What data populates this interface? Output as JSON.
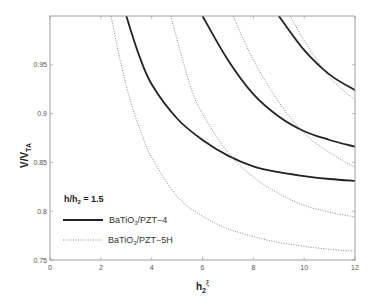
{
  "chart_data": {
    "type": "line",
    "title": "",
    "xlabel": "h2ξ",
    "xlabel_main": "h",
    "xlabel_sub": "2",
    "xlabel_sup": "ξ",
    "ylabel": "V/VTA",
    "ylabel_main": "V/V",
    "ylabel_sub": "TA",
    "xlim": [
      0,
      12
    ],
    "ylim": [
      0.75,
      1.0
    ],
    "xticks": [
      "0",
      "2",
      "4",
      "6",
      "8",
      "10",
      "12"
    ],
    "yticks": [
      "0.75",
      "0.8",
      "0.85",
      "0.9",
      "0.95"
    ],
    "grid": false,
    "legend": {
      "position": "lower-left",
      "title": "h/h₂ = 1.5",
      "title_main": "h/h",
      "title_sub": "2",
      "title_rest": " = 1.5",
      "entries": [
        {
          "label": "BaTiO3/PZT-4",
          "main": "BaTiO",
          "sub": "3",
          "rest": "/PZT−4",
          "style": "solid"
        },
        {
          "label": "BaTiO3/PZT-5H",
          "main": "BaTiO",
          "sub": "3",
          "rest": "/PZT−5H",
          "style": "dotted"
        }
      ]
    },
    "series": [
      {
        "name": "BaTiO3/PZT-4 (1)",
        "style": "solid",
        "color": "#222222",
        "x": [
          3.0,
          3.5,
          4,
          5,
          6,
          7,
          8,
          9,
          10,
          11,
          12
        ],
        "y": [
          1.0,
          0.96,
          0.93,
          0.895,
          0.873,
          0.857,
          0.846,
          0.84,
          0.836,
          0.833,
          0.831
        ]
      },
      {
        "name": "BaTiO3/PZT-4 (2)",
        "style": "solid",
        "color": "#222222",
        "x": [
          6.0,
          7,
          8,
          9,
          10,
          11,
          12
        ],
        "y": [
          1.0,
          0.955,
          0.92,
          0.897,
          0.882,
          0.873,
          0.866
        ]
      },
      {
        "name": "BaTiO3/PZT-4 (3)",
        "style": "solid",
        "color": "#222222",
        "x": [
          9.0,
          10,
          11,
          12
        ],
        "y": [
          1.0,
          0.965,
          0.94,
          0.924
        ]
      },
      {
        "name": "BaTiO3/PZT-5H (1)",
        "style": "dotted",
        "color": "#888888",
        "x": [
          2.4,
          2.8,
          3.2,
          3.6,
          4,
          5,
          6,
          7,
          8,
          9,
          10,
          11,
          12
        ],
        "y": [
          1.0,
          0.95,
          0.91,
          0.88,
          0.855,
          0.815,
          0.795,
          0.782,
          0.774,
          0.768,
          0.764,
          0.761,
          0.759
        ]
      },
      {
        "name": "BaTiO3/PZT-5H (2)",
        "style": "dotted",
        "color": "#888888",
        "x": [
          4.75,
          5.5,
          6,
          7,
          8,
          9,
          10,
          11,
          12
        ],
        "y": [
          1.0,
          0.93,
          0.9,
          0.86,
          0.835,
          0.818,
          0.806,
          0.799,
          0.794
        ]
      },
      {
        "name": "BaTiO3/PZT-5H (3)",
        "style": "dotted",
        "color": "#888888",
        "x": [
          7.2,
          8,
          9,
          10,
          11,
          12
        ],
        "y": [
          1.0,
          0.955,
          0.912,
          0.88,
          0.86,
          0.845
        ]
      },
      {
        "name": "BaTiO3/PZT-5H (4)",
        "style": "dotted",
        "color": "#888888",
        "x": [
          9.45,
          10,
          11,
          12
        ],
        "y": [
          1.0,
          0.975,
          0.937,
          0.914
        ]
      }
    ]
  }
}
